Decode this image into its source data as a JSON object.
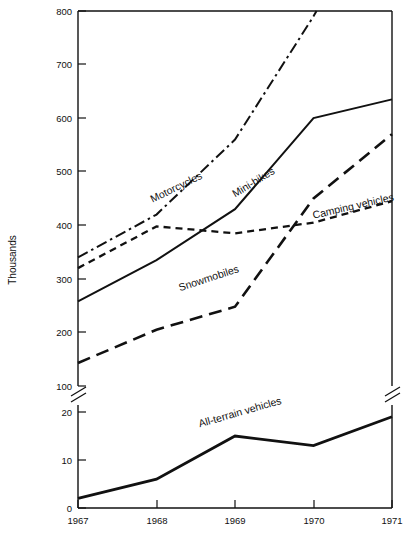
{
  "chart_data": {
    "type": "line",
    "title": "",
    "xlabel": "",
    "ylabel": "Thousands",
    "x": [
      1967,
      1968,
      1969,
      1970,
      1971
    ],
    "categories": [
      "1967",
      "1968",
      "1969",
      "1970",
      "1971"
    ],
    "grid": false,
    "legend_position": "inline-labels",
    "broken_axis": true,
    "upper_panel": {
      "ylim": [
        100,
        800
      ],
      "yticks": [
        100,
        200,
        300,
        400,
        500,
        600,
        700,
        800
      ],
      "ytick_labels": [
        "100",
        "200",
        "300",
        "400",
        "500",
        "600",
        "700",
        "800"
      ]
    },
    "lower_panel": {
      "ylim": [
        0,
        20
      ],
      "yticks": [
        0,
        10,
        20
      ],
      "ytick_labels": [
        "0",
        "10",
        "20"
      ]
    },
    "series": [
      {
        "name": "Motorcycles",
        "panel": "upper",
        "linestyle": "dash-dot",
        "values": [
          340,
          420,
          560,
          790,
          1050
        ],
        "clipped_above_axis": true,
        "label_x": 1967.95,
        "label_y": 442,
        "label_rotation": -26
      },
      {
        "name": "Mini-bikes",
        "panel": "upper",
        "linestyle": "solid",
        "values": [
          258,
          335,
          430,
          600,
          635
        ],
        "clipped_above_axis": false,
        "label_x": 1969.0,
        "label_y": 452,
        "label_rotation": -31
      },
      {
        "name": "Camping vehicles",
        "panel": "upper",
        "linestyle": "short-dash",
        "values": [
          320,
          398,
          385,
          405,
          445
        ],
        "clipped_above_axis": false,
        "label_x": 1970.0,
        "label_y": 412,
        "label_rotation": -13
      },
      {
        "name": "Snowmobiles",
        "panel": "upper",
        "linestyle": "long-dash",
        "values": [
          143,
          205,
          248,
          450,
          570
        ],
        "clipped_above_axis": false,
        "label_x": 1968.3,
        "label_y": 277,
        "label_rotation": -18
      },
      {
        "name": "All-terrain vehicles",
        "panel": "lower",
        "linestyle": "thick-solid",
        "values": [
          2,
          6,
          15,
          13,
          19
        ],
        "clipped_above_axis": false,
        "label_x": 1968.55,
        "label_y": 16.8,
        "label_rotation": -16
      }
    ]
  },
  "axes": {
    "y_title": "Thousands",
    "y_upper_ticks": [
      "800",
      "700",
      "600",
      "500",
      "400",
      "300",
      "200",
      "100"
    ],
    "y_lower_ticks": [
      "20",
      "10",
      "0"
    ],
    "x_ticks": [
      "1967",
      "1968",
      "1969",
      "1970",
      "1971"
    ]
  },
  "labels": {
    "motorcycles": "Motorcycles",
    "mini_bikes": "Mini-bikes",
    "camping_vehicles": "Camping vehicles",
    "snowmobiles": "Snowmobiles",
    "all_terrain_vehicles": "All-terrain vehicles"
  },
  "colors": {
    "ink": "#111111",
    "background": "#ffffff"
  }
}
